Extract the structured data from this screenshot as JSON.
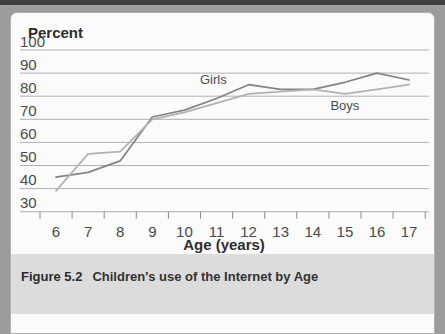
{
  "caption": {
    "figure_label": "Figure 5.2",
    "text": "Children's use of the Internet by Age"
  },
  "chart_data": {
    "type": "line",
    "title": "Percent",
    "xlabel": "Age (years)",
    "x": [
      6,
      7,
      8,
      9,
      10,
      11,
      12,
      13,
      14,
      15,
      16,
      17
    ],
    "ylim": [
      30,
      100
    ],
    "yticks": [
      100,
      90,
      80,
      70,
      60,
      50,
      40,
      30
    ],
    "grid": "horizontal",
    "legend": "inline-labels",
    "grid_color": "#b0b0b0",
    "tick_color": "#8a8a8a",
    "text_color": "#4a4a4a",
    "title_color": "#2e2e2e",
    "series": [
      {
        "name": "Girls",
        "color": "#848484",
        "values": [
          45,
          47,
          52,
          71,
          74,
          79,
          85,
          83,
          83,
          86,
          90,
          87
        ],
        "label_at": {
          "x": 10.9,
          "y": 85.5
        }
      },
      {
        "name": "Boys",
        "color": "#b2b2b2",
        "values": [
          39,
          55,
          56,
          70,
          73,
          77,
          81,
          82,
          83,
          81,
          83,
          85
        ],
        "label_at": {
          "x": 15.0,
          "y": 74.2
        }
      }
    ]
  }
}
